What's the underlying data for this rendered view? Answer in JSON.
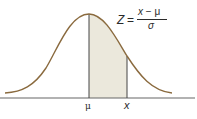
{
  "diagram": {
    "title": "",
    "type": "normal-distribution-curve",
    "formula": {
      "lhs": "Z",
      "equals": "=",
      "numerator_var": "x",
      "numerator_op": " − ",
      "numerator_mean": "μ",
      "denominator": "σ"
    },
    "axis_labels": {
      "mean": "μ",
      "x": "x"
    },
    "shaded_region": {
      "from": "μ",
      "to": "x"
    },
    "colors": {
      "curve": "#8a6a3e",
      "shade": "#ebe8dc",
      "axis": "#555555",
      "lines": "#444444"
    }
  }
}
